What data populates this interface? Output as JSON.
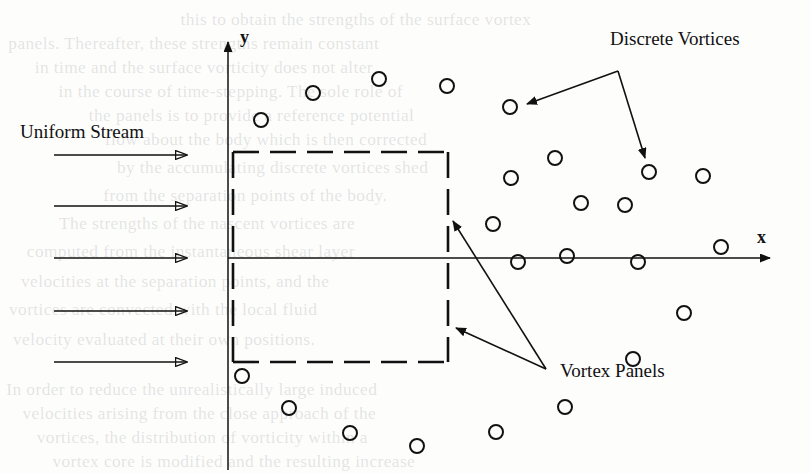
{
  "figure": {
    "background_color": "#fdfdfc",
    "ink_color": "#111111",
    "width": 811,
    "height": 473
  },
  "axes": {
    "x_label": "x",
    "y_label": "y",
    "origin": {
      "x": 228,
      "y": 258
    },
    "x_axis": {
      "x1": 228,
      "y1": 258,
      "x2": 770,
      "y2": 258
    },
    "y_axis": {
      "x1": 228,
      "y1": 470,
      "x2": 228,
      "y2": 42
    }
  },
  "labels": {
    "uniform_stream": "Uniform Stream",
    "discrete_vortices": "Discrete Vortices",
    "vortex_panels": "Vortex Panels"
  },
  "body": {
    "name": "square-bluff-body",
    "style": "dashed",
    "left": 233,
    "top": 152,
    "right": 448,
    "bottom": 362
  },
  "stream_arrows": [
    {
      "x1": 54,
      "y1": 155,
      "x2": 187,
      "y2": 155
    },
    {
      "x1": 54,
      "y1": 206,
      "x2": 187,
      "y2": 206
    },
    {
      "x1": 54,
      "y1": 258,
      "x2": 187,
      "y2": 258
    },
    {
      "x1": 54,
      "y1": 311,
      "x2": 187,
      "y2": 311
    },
    {
      "x1": 54,
      "y1": 362,
      "x2": 187,
      "y2": 362
    }
  ],
  "pointer_lines": {
    "discrete_vortices": {
      "fork": {
        "x": 618,
        "y": 71
      },
      "branches": [
        {
          "x": 527,
          "y": 104
        },
        {
          "x": 645,
          "y": 158
        }
      ]
    },
    "vortex_panels": {
      "fork": {
        "x": 546,
        "y": 369
      },
      "branches": [
        {
          "x": 453,
          "y": 221
        },
        {
          "x": 456,
          "y": 328
        }
      ]
    }
  },
  "chart_data": {
    "type": "scatter",
    "xlabel": "x",
    "ylabel": "y",
    "grid": false,
    "legend": "none",
    "marker": "open-circle",
    "marker_radius_px": 7,
    "series": [
      {
        "name": "Discrete Vortices",
        "points": [
          {
            "x": 261,
            "y": 120
          },
          {
            "x": 313,
            "y": 93
          },
          {
            "x": 379,
            "y": 79
          },
          {
            "x": 447,
            "y": 86
          },
          {
            "x": 510,
            "y": 107
          },
          {
            "x": 511,
            "y": 178
          },
          {
            "x": 555,
            "y": 158
          },
          {
            "x": 649,
            "y": 172
          },
          {
            "x": 703,
            "y": 176
          },
          {
            "x": 581,
            "y": 203
          },
          {
            "x": 625,
            "y": 205
          },
          {
            "x": 493,
            "y": 224
          },
          {
            "x": 518,
            "y": 262
          },
          {
            "x": 567,
            "y": 256
          },
          {
            "x": 638,
            "y": 262
          },
          {
            "x": 721,
            "y": 247
          },
          {
            "x": 684,
            "y": 313
          },
          {
            "x": 633,
            "y": 359
          },
          {
            "x": 242,
            "y": 376
          },
          {
            "x": 289,
            "y": 408
          },
          {
            "x": 350,
            "y": 433
          },
          {
            "x": 417,
            "y": 446
          },
          {
            "x": 496,
            "y": 432
          },
          {
            "x": 565,
            "y": 407
          }
        ]
      }
    ]
  },
  "bleed_text": [
    {
      "text": "this to obtain the strengths of the surface vortex",
      "x": 184,
      "y": 10
    },
    {
      "text": "panels. Thereafter, these strengths remain constant",
      "x": 12,
      "y": 34
    },
    {
      "text": "in time and the surface vorticity does not alter",
      "x": 38,
      "y": 58
    },
    {
      "text": "in the course of time-stepping. The sole role of",
      "x": 62,
      "y": 82
    },
    {
      "text": "the panels is to provide a reference potential",
      "x": 92,
      "y": 106
    },
    {
      "text": "flow about the body which is then corrected",
      "x": 108,
      "y": 130
    },
    {
      "text": "by the accumulating discrete vortices shed",
      "x": 120,
      "y": 158
    },
    {
      "text": "from the separation points of the body.",
      "x": 106,
      "y": 186
    },
    {
      "text": "The strengths of the nascent vortices are",
      "x": 62,
      "y": 214
    },
    {
      "text": "computed from the instantaneous shear layer",
      "x": 30,
      "y": 242
    },
    {
      "text": "velocities at the separation points, and the",
      "x": 24,
      "y": 272
    },
    {
      "text": "vortices are convected with the local fluid",
      "x": 12,
      "y": 300
    },
    {
      "text": "velocity evaluated at their own positions.",
      "x": 16,
      "y": 330
    },
    {
      "text": "In order to reduce the unrealistically large induced",
      "x": 10,
      "y": 380
    },
    {
      "text": "velocities arising from the close approach of the",
      "x": 26,
      "y": 404
    },
    {
      "text": "vortices, the distribution of vorticity within a",
      "x": 40,
      "y": 428
    },
    {
      "text": "vortex core is modified and the resulting increase",
      "x": 56,
      "y": 452
    }
  ]
}
